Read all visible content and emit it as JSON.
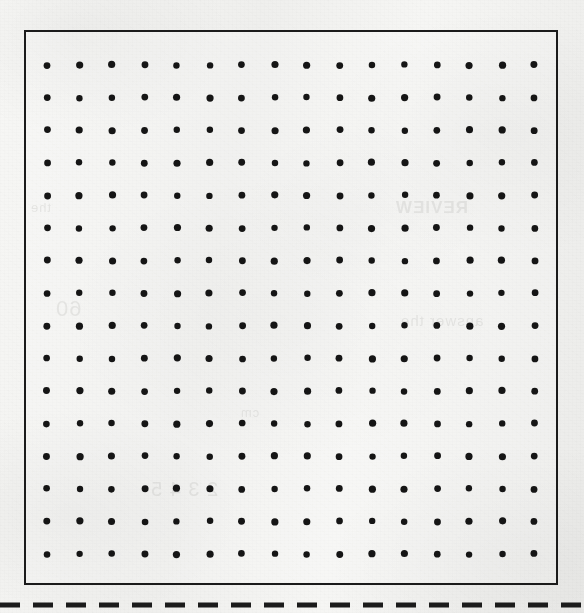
{
  "page": {
    "kind": "worksheet-dot-paper",
    "width": 584,
    "height": 613,
    "paper_color": "#f4f4f2",
    "ink_color": "#1b1b1b"
  },
  "dot_grid": {
    "label": "16 by 16 dot paper grid",
    "columns": 16,
    "rows": 16,
    "dot_count": 256,
    "dot_radius": 3.4,
    "dot_color": "#151515",
    "spacing_x": 32.5,
    "spacing_y": 32.6,
    "origin_x": 21,
    "origin_y": 33,
    "frame": {
      "x": 24,
      "y": 30,
      "width": 534,
      "height": 555,
      "border_width": 2.5,
      "border_color": "#1b1b1b"
    }
  },
  "cut_line": {
    "label": "dashed cut line",
    "y": 604,
    "thickness": 5,
    "dash_length": 20,
    "gap_length": 13,
    "color": "#1b1b1b"
  },
  "bleed_through": {
    "note": "faint mirrored ghost text from reverse side of the scanned page",
    "fragments": [
      "REVIEW",
      "answer the",
      "60",
      "2 3 4 5",
      "the",
      "cm"
    ]
  }
}
